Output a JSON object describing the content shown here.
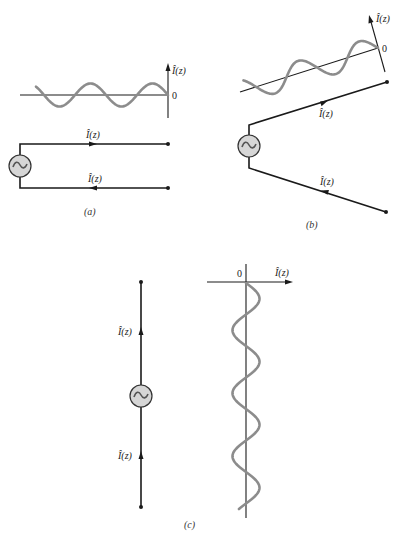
{
  "figure": {
    "panels": [
      {
        "id": "a",
        "caption": "(a)",
        "description": "Two-wire transmission line fed by AC source; open ends; current standing wave plotted above",
        "current_label_top": "Î(z)",
        "current_label_bottom": "Î(z)",
        "axis_label": "Î(z)",
        "origin_label": "0",
        "source_symbol": "~"
      },
      {
        "id": "b",
        "caption": "(b)",
        "description": "Wires flared apart (V shape) from AC source; current distribution plotted along tilted axis",
        "current_label_top": "Î(z)",
        "current_label_bottom": "Î(z)",
        "axis_label": "Î(z)",
        "origin_label": "0",
        "source_symbol": "~"
      },
      {
        "id": "c",
        "caption": "(c)",
        "description": "Wires fully opened into a straight dipole with center AC source; current distribution plotted along vertical axis",
        "current_label_top": "Î(z)",
        "current_label_bottom": "Î(z)",
        "axis_label": "Î(z)",
        "origin_label": "0",
        "source_symbol": "~"
      }
    ],
    "colors": {
      "wire": "#1a1a1a",
      "wave": "#8c8c8c",
      "source_fill": "#d6d6d6",
      "background": "#ffffff"
    }
  }
}
